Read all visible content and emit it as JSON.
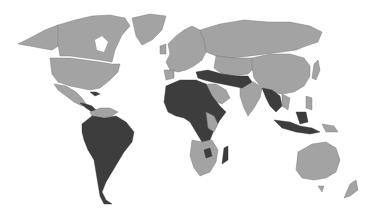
{
  "map": {
    "type": "choropleth",
    "projection": "world",
    "colors": {
      "background": "#ffffff",
      "category_light": "#a3a3a3",
      "category_dark": "#3d3d3d",
      "border": "#6e6e6e"
    },
    "regions_dark": [
      "South America",
      "Central America (partial)",
      "Caribbean (partial)",
      "North Africa",
      "West Africa",
      "Central Africa",
      "Horn of Africa",
      "Middle East (partial)",
      "Iran",
      "Afghanistan",
      "Pakistan",
      "Myanmar",
      "Thailand",
      "Cambodia",
      "Laos",
      "Indonesia (partial)",
      "Papua New Guinea (partial)",
      "Madagascar",
      "Turkey"
    ],
    "regions_light": [
      "North America",
      "Greenland",
      "Europe",
      "Russia",
      "Central Asia",
      "China",
      "Mongolia",
      "India",
      "Saudi Arabia",
      "Southern Africa",
      "East Africa (partial)",
      "Australia",
      "New Zealand",
      "Japan",
      "Philippines"
    ]
  }
}
